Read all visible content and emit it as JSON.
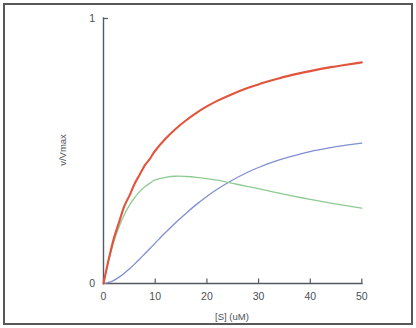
{
  "figure": {
    "border_color": "#585858",
    "background": "#ffffff"
  },
  "chart_data": {
    "type": "line",
    "title": "",
    "subtitle": "",
    "xlabel": "[S] (uM)",
    "ylabel": "v/Vmax",
    "xlim": [
      0,
      50
    ],
    "ylim": [
      0,
      1
    ],
    "x_ticks": [
      "0",
      "10",
      "20",
      "30",
      "40",
      "50"
    ],
    "x_tick_values": [
      0,
      10,
      20,
      30,
      40,
      50
    ],
    "y_ticks": [
      "0",
      "1"
    ],
    "y_tick_values": [
      0,
      1
    ],
    "grid": false,
    "legend": "none",
    "annotations": [],
    "x": [
      0,
      1,
      2,
      3,
      4,
      5,
      6,
      7,
      8,
      9,
      10,
      12,
      14,
      16,
      18,
      20,
      22,
      25,
      28,
      30,
      33,
      36,
      40,
      44,
      47,
      50
    ],
    "series": [
      {
        "name": "michaelis-menten",
        "color": "#e2543c",
        "width": 2.1,
        "values": [
          0.0,
          0.09,
          0.17,
          0.23,
          0.29,
          0.33,
          0.375,
          0.41,
          0.445,
          0.47,
          0.5,
          0.545,
          0.583,
          0.615,
          0.643,
          0.667,
          0.688,
          0.714,
          0.737,
          0.75,
          0.767,
          0.783,
          0.8,
          0.815,
          0.824,
          0.833
        ]
      },
      {
        "name": "substrate-inhibition",
        "color": "#8ecb92",
        "width": 1.3,
        "values": [
          0.0,
          0.087,
          0.157,
          0.213,
          0.258,
          0.294,
          0.323,
          0.346,
          0.364,
          0.378,
          0.39,
          0.4,
          0.404,
          0.403,
          0.4,
          0.395,
          0.389,
          0.377,
          0.365,
          0.357,
          0.344,
          0.332,
          0.317,
          0.303,
          0.293,
          0.284
        ]
      },
      {
        "name": "cooperative-sigmoid",
        "color": "#808fd2",
        "width": 1.3,
        "values": [
          0.0,
          0.004,
          0.012,
          0.024,
          0.038,
          0.055,
          0.073,
          0.092,
          0.112,
          0.132,
          0.152,
          0.192,
          0.23,
          0.265,
          0.298,
          0.328,
          0.355,
          0.39,
          0.42,
          0.437,
          0.459,
          0.477,
          0.497,
          0.512,
          0.521,
          0.529
        ]
      }
    ]
  }
}
